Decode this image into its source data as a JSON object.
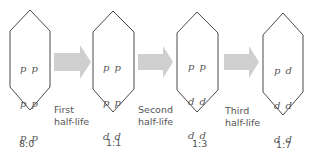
{
  "stages": [
    {
      "atoms": [
        "p p",
        "p p",
        "p p",
        "p p"
      ],
      "ratio": "8:0"
    },
    {
      "atoms": [
        "p p",
        "p p",
        "d d",
        "d d"
      ],
      "ratio": "1:1"
    },
    {
      "atoms": [
        "p p",
        "d d",
        "d d",
        "d d"
      ],
      "ratio": "1:3"
    },
    {
      "atoms": [
        "p d",
        "d d",
        "d d",
        "d d"
      ],
      "ratio": "1:7"
    }
  ],
  "transitions": [
    {
      "line1": "First",
      "line2": "half-life"
    },
    {
      "line1": "Second",
      "line2": "half-life"
    },
    {
      "line1": "Third",
      "line2": "half-life"
    }
  ],
  "colors": {
    "arrow": "#cfcfcf",
    "outline": "#4a4a4a",
    "text": "#555555"
  }
}
